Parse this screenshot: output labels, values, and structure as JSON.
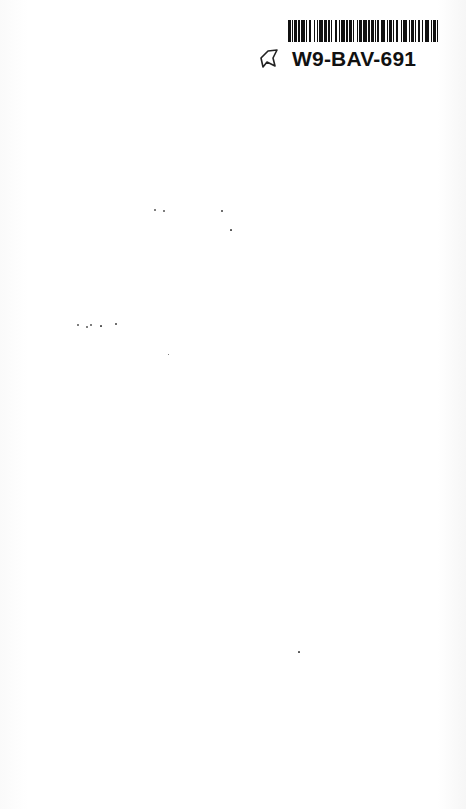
{
  "page": {
    "type": "scanned-blank-page",
    "background_color": "#ffffff"
  },
  "barcode_label": {
    "id_text": "W9-BAV-691",
    "icon": "bookmark-icon",
    "bar_pattern": [
      2,
      1,
      1,
      1,
      2,
      1,
      1,
      1,
      3,
      1,
      1,
      1,
      2,
      2,
      1,
      1,
      1,
      1,
      3,
      1,
      2,
      1,
      1,
      1,
      1,
      2,
      2,
      1,
      1,
      1,
      3,
      1,
      1,
      1,
      2,
      1,
      1,
      2,
      1,
      1,
      2,
      1,
      3,
      1,
      1,
      1,
      2,
      1,
      1,
      1,
      1,
      2,
      3,
      1,
      1,
      1,
      2,
      1,
      1,
      1,
      2,
      2,
      1,
      1,
      3,
      1,
      1,
      1,
      2,
      1,
      1,
      1,
      2,
      1,
      1,
      2,
      3,
      1,
      1,
      1,
      2,
      1,
      1,
      1
    ]
  },
  "specks": [
    {
      "x": 155,
      "y": 210,
      "r": 1.3
    },
    {
      "x": 164,
      "y": 211,
      "r": 1.0
    },
    {
      "x": 222,
      "y": 211,
      "r": 0.7
    },
    {
      "x": 231,
      "y": 230,
      "r": 0.6
    },
    {
      "x": 78,
      "y": 325,
      "r": 1.2
    },
    {
      "x": 87,
      "y": 327,
      "r": 1.4
    },
    {
      "x": 91,
      "y": 325,
      "r": 1.2
    },
    {
      "x": 101,
      "y": 326,
      "r": 0.6
    },
    {
      "x": 116,
      "y": 324,
      "r": 0.7
    },
    {
      "x": 168,
      "y": 354,
      "r": 0.5
    },
    {
      "x": 299,
      "y": 652,
      "r": 0.6
    }
  ]
}
